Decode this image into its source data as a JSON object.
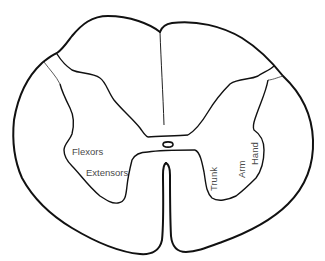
{
  "diagram": {
    "colors": {
      "background": "#ffffff",
      "outline": "#111111",
      "thin_line": "#333333",
      "label_text": "#4a4a4a"
    },
    "labels": {
      "left_horn": {
        "flexors": "Flexors",
        "extensors": "Extensors"
      },
      "right_horn": {
        "trunk": "Trunk",
        "arm": "Arm",
        "hand": "Hand"
      }
    }
  }
}
